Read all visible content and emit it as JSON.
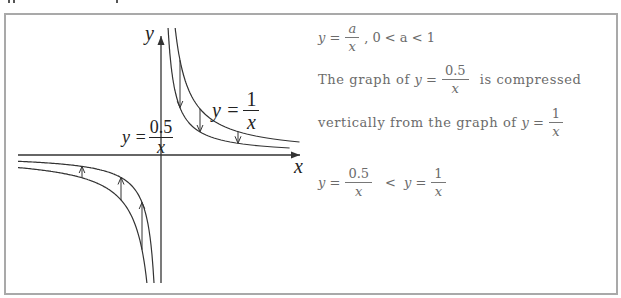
{
  "graph": {
    "axis_x_label": "x",
    "axis_y_label": "y",
    "curve_1": {
      "label_lhs": "y =",
      "label_num": "1",
      "label_den": "x",
      "k": 1
    },
    "curve_2": {
      "label_lhs": "y =",
      "label_num": "0.5",
      "label_den": "x",
      "k": 0.5
    },
    "arrow_direction_note": "arrows point from y=1/x toward y=0.5/x"
  },
  "notes": {
    "line1": {
      "lhs": "y =",
      "num": "a",
      "den": "x",
      "tail": ", 0 < a < 1"
    },
    "line2": {
      "prefix": "The graph of ",
      "lhs": "y =",
      "num": "0.5",
      "den": "x",
      "suffix": "is compressed"
    },
    "line3": {
      "prefix": "vertically from the graph of ",
      "lhs": "y =",
      "num": "1",
      "den": "x"
    },
    "line4": {
      "lhs_a": "y =",
      "num_a": "0.5",
      "den_a": "x",
      "op": "<",
      "lhs_b": "y =",
      "num_b": "1",
      "den_b": "x"
    }
  },
  "colors": {
    "frame_border": "#a9a9a9",
    "curve": "#333333",
    "text": "#6b6b6b"
  }
}
